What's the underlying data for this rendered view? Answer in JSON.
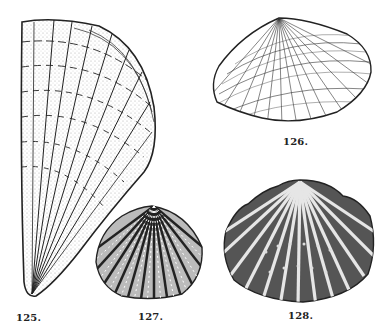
{
  "plate": {
    "background": "#ffffff",
    "ink": "#222222",
    "figures": [
      {
        "id": "125",
        "label": "125.",
        "description": "elongate fan-shaped shell with concentric and radial ribbing, stippled shading"
      },
      {
        "id": "126",
        "label": "126.",
        "description": "transversely oval shell with fine radial ribs and concentric growth lines"
      },
      {
        "id": "127",
        "label": "127.",
        "description": "rounded cockle-like shell with beaded radial ribs"
      },
      {
        "id": "128",
        "label": "128.",
        "description": "scallop-like shell with broad radial ribs and small nodes"
      }
    ]
  }
}
